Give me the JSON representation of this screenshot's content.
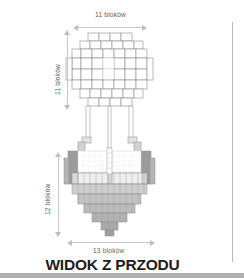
{
  "figure": {
    "title": "WIDOK Z PRZODU",
    "view_type": "front-view",
    "language": "pl"
  },
  "dimensions": {
    "top_width": "11 bloków",
    "left_upper_height": "11 bloków",
    "left_lower_height": "12 bloków",
    "bottom_width": "13 bloków"
  },
  "units": {
    "name": "bloków",
    "top_width_value": 11,
    "canopy_height_value": 11,
    "base_height_value": 12,
    "base_width_value": 13
  },
  "colors": {
    "outline": "#8a8a8a",
    "light_fill": "#ffffff",
    "mid_fill": "#d6d6d6",
    "dark_fill": "#a8a8a8",
    "darker_fill": "#8d8d8d",
    "dim_line": "#c6c6c6",
    "label_text": "#5f5f5f",
    "title_text": "#1d1d1d",
    "margin_rule": "#b9b9b9",
    "bottom_band": "#b0b0b0"
  },
  "schematic": {
    "description": "Minecraft block schematic front elevation of a tree/mushroom-like build: a wide stepped canopy on top, two thin trunk columns in the middle, and a broad stepped base below.",
    "canopy_rows": 11,
    "base_rows": 12,
    "trunk_columns": 2
  }
}
